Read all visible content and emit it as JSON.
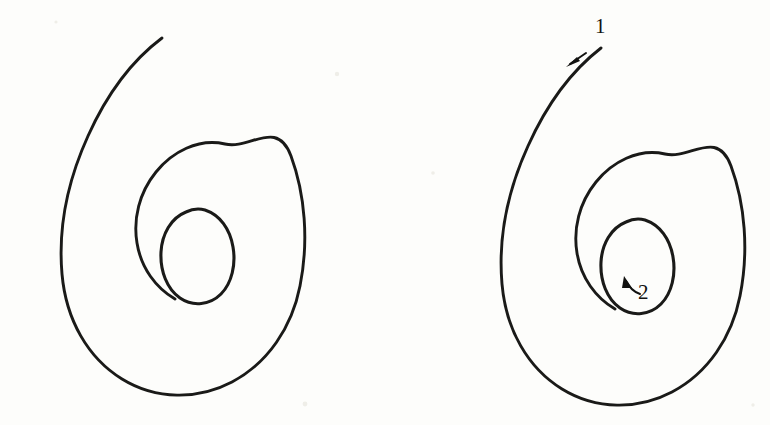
{
  "page": {
    "background_color": "#fdfdfb",
    "ink_color": "#1a1a18",
    "width": 770,
    "height": 425
  },
  "figures": [
    {
      "id": "left-spiral",
      "name": "unlabeled-spiral",
      "description": "Hand-drawn inward spiral with two and a half turns ending in a closed inner loop",
      "annotations": []
    },
    {
      "id": "right-spiral",
      "name": "annotated-spiral",
      "description": "Same hand-drawn inward spiral annotated with drawing-order arrows",
      "annotations": [
        {
          "label": "1",
          "name": "annotation-1",
          "meaning": "start of stroke at outer tail",
          "arrow_direction": "down-left",
          "arrow_style": "straight"
        },
        {
          "label": "2",
          "name": "annotation-2",
          "meaning": "end of stroke at inner loop",
          "arrow_direction": "up-left",
          "arrow_style": "curved"
        }
      ]
    }
  ],
  "geometry": {
    "left": {
      "spiral_d": "M 162 38 C 130 62 106 96 88 136 C 68 180 58 228 62 274 C 66 320 88 358 122 379 C 156 400 198 400 232 382 C 268 363 292 327 300 286 C 309 241 305 194 291 156 C 277 118 250 150 225 144 C 198 138 172 152 156 172 C 139 193 133 219 137 243 C 141 268 156 288 175 299",
      "inner_loop_d": "M 186 212 C 171 218 162 234 161 252 C 160 271 167 289 180 298 C 193 307 210 305 221 294 C 232 283 236 264 233 247 C 230 229 220 215 205 210 C 198 208 192 209 186 212 Z"
    },
    "right": {
      "spiral_d": "M 601 48 C 570 72 546 106 528 146 C 508 190 498 238 502 284 C 506 330 528 368 562 389 C 596 410 638 410 672 392 C 708 373 732 337 740 296 C 749 251 745 204 731 166 C 717 128 690 160 665 154 C 638 148 612 162 596 182 C 579 203 573 229 577 253 C 581 278 596 298 615 309",
      "inner_loop_d": "M 626 222 C 611 228 602 244 601 262 C 600 281 607 299 620 308 C 633 317 650 315 661 304 C 672 293 676 274 673 257 C 670 239 660 225 645 220 C 638 218 632 219 626 222 Z"
    },
    "annotation_1": {
      "shaft_d": "M 586 53 L 570 64",
      "head_points": "566,67 580,61 577,57",
      "label_x": 595,
      "label_y": 33
    },
    "annotation_2": {
      "shaft_d": "M 640 294 C 634 292 629 287 626 281",
      "head_points": "624,276 632,288 622,288",
      "label_x": 638,
      "label_y": 299
    }
  }
}
